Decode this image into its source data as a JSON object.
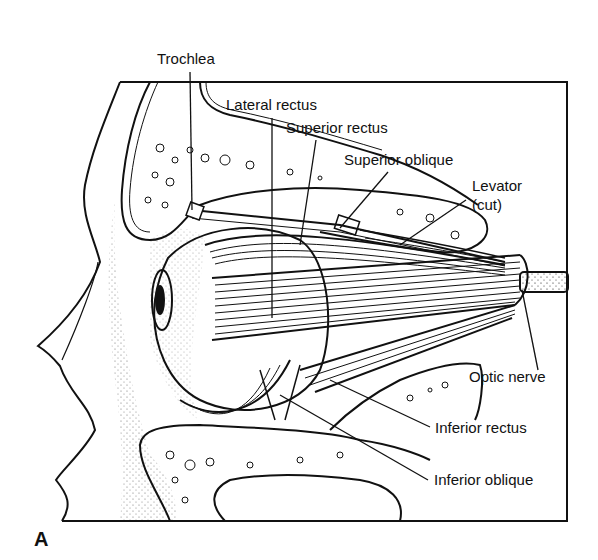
{
  "figure": {
    "panel_letter": "A",
    "colors": {
      "ink": "#111111",
      "background": "#ffffff"
    },
    "labels": {
      "trochlea": "Trochlea",
      "lateral_rectus": "Lateral rectus",
      "superior_rectus": "Superior rectus",
      "superior_oblique": "Superior oblique",
      "levator_line1": "Levator",
      "levator_line2": "(cut)",
      "optic_nerve": "Optic nerve",
      "inferior_rectus": "Inferior rectus",
      "inferior_oblique": "Inferior oblique"
    }
  }
}
